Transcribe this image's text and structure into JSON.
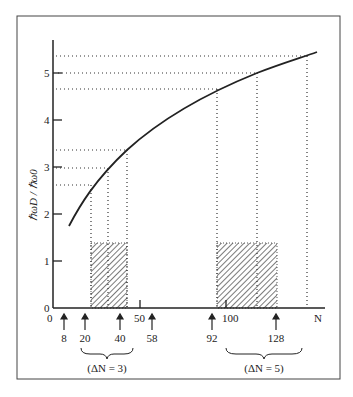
{
  "diagram": {
    "ylabel": "ħω_D / ħω_0",
    "ylabel_display": "ℏωD / ℏω0",
    "y_ticks": [
      "0",
      "1",
      "2",
      "3",
      "4",
      "5"
    ],
    "x_ticks": [
      "0",
      "50",
      "100",
      "N"
    ],
    "arrows": [
      {
        "label": "8",
        "n": 8
      },
      {
        "label": "20",
        "n": 20
      },
      {
        "label": "40",
        "n": 40
      },
      {
        "label": "58",
        "n": 58
      },
      {
        "label": "92",
        "n": 92
      },
      {
        "label": "128",
        "n": 128
      }
    ],
    "braces": [
      {
        "label": "(ΔN = 3)",
        "from": 20,
        "to": 40
      },
      {
        "label": "(ΔN = 5)",
        "from": 92,
        "to": 128
      }
    ],
    "shaded_regions": [
      {
        "from_n": 20,
        "to_n": 40,
        "height": 1.4
      },
      {
        "from_n": 92,
        "to_n": 128,
        "height": 1.4
      }
    ],
    "curve": "increasing concave curve from N≈8 (≈1.8) to N≈140 (≈5.5)",
    "dotted_levels": [
      2.6,
      3.0,
      3.4,
      4.65,
      5.0,
      5.35
    ]
  }
}
